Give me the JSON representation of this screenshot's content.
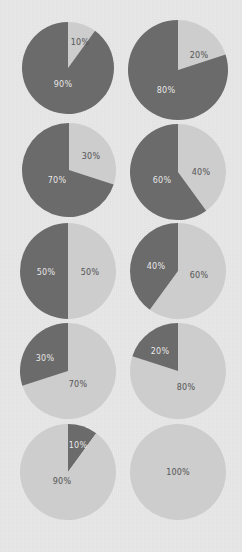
{
  "chart_data": {
    "type": "pie",
    "title": "",
    "xlabel": "",
    "ylabel": "",
    "legend": [],
    "colors": {
      "dark": "#6b6b6b",
      "light": "#cdcdcd",
      "background": "#e8e8e8",
      "label_on_dark": "#eceaea",
      "label_on_light": "#5c5c5c"
    },
    "grid_rows": 5,
    "grid_cols": 2,
    "charts": [
      {
        "id": "pie-1",
        "row": 1,
        "col": 1,
        "cx": 68,
        "cy": 68,
        "r": 46,
        "slices": [
          {
            "name": "light",
            "value": 10,
            "label": "10%",
            "color": "light",
            "start": 0,
            "end": 10,
            "lx": 80,
            "ly": 42
          },
          {
            "name": "dark",
            "value": 90,
            "label": "90%",
            "color": "dark",
            "start": 10,
            "end": 100,
            "lx": 63,
            "ly": 84
          }
        ]
      },
      {
        "id": "pie-2",
        "row": 1,
        "col": 2,
        "cx": 178,
        "cy": 70,
        "r": 50,
        "slices": [
          {
            "name": "light",
            "value": 20,
            "label": "20%",
            "color": "light",
            "start": 0,
            "end": 20,
            "lx": 199,
            "ly": 55
          },
          {
            "name": "dark",
            "value": 80,
            "label": "80%",
            "color": "dark",
            "start": 20,
            "end": 100,
            "lx": 166,
            "ly": 90
          }
        ]
      },
      {
        "id": "pie-3",
        "row": 2,
        "col": 1,
        "cx": 69,
        "cy": 170,
        "r": 47,
        "slices": [
          {
            "name": "light",
            "value": 30,
            "label": "30%",
            "color": "light",
            "start": 0,
            "end": 30,
            "lx": 91,
            "ly": 156
          },
          {
            "name": "dark",
            "value": 70,
            "label": "70%",
            "color": "dark",
            "start": 30,
            "end": 100,
            "lx": 57,
            "ly": 180
          }
        ]
      },
      {
        "id": "pie-4",
        "row": 2,
        "col": 2,
        "cx": 178,
        "cy": 172,
        "r": 48,
        "slices": [
          {
            "name": "light",
            "value": 40,
            "label": "40%",
            "color": "light",
            "start": 0,
            "end": 40,
            "lx": 201,
            "ly": 172
          },
          {
            "name": "dark",
            "value": 60,
            "label": "60%",
            "color": "dark",
            "start": 40,
            "end": 100,
            "lx": 162,
            "ly": 180
          }
        ]
      },
      {
        "id": "pie-5",
        "row": 3,
        "col": 1,
        "cx": 68,
        "cy": 271,
        "r": 48,
        "slices": [
          {
            "name": "light",
            "value": 50,
            "label": "50%",
            "color": "light",
            "start": 0,
            "end": 50,
            "lx": 90,
            "ly": 272
          },
          {
            "name": "dark",
            "value": 50,
            "label": "50%",
            "color": "dark",
            "start": 50,
            "end": 100,
            "lx": 46,
            "ly": 272
          }
        ]
      },
      {
        "id": "pie-6",
        "row": 3,
        "col": 2,
        "cx": 178,
        "cy": 271,
        "r": 48,
        "slices": [
          {
            "name": "light",
            "value": 60,
            "label": "60%",
            "color": "light",
            "start": 0,
            "end": 60,
            "lx": 199,
            "ly": 275
          },
          {
            "name": "dark",
            "value": 40,
            "label": "40%",
            "color": "dark",
            "start": 60,
            "end": 100,
            "lx": 156,
            "ly": 266
          }
        ]
      },
      {
        "id": "pie-7",
        "row": 4,
        "col": 1,
        "cx": 68,
        "cy": 371,
        "r": 48,
        "slices": [
          {
            "name": "light",
            "value": 70,
            "label": "70%",
            "color": "light",
            "start": 0,
            "end": 70,
            "lx": 78,
            "ly": 384
          },
          {
            "name": "dark",
            "value": 30,
            "label": "30%",
            "color": "dark",
            "start": 70,
            "end": 100,
            "lx": 45,
            "ly": 358
          }
        ]
      },
      {
        "id": "pie-8",
        "row": 4,
        "col": 2,
        "cx": 178,
        "cy": 371,
        "r": 48,
        "slices": [
          {
            "name": "light",
            "value": 80,
            "label": "80%",
            "color": "light",
            "start": 0,
            "end": 80,
            "lx": 186,
            "ly": 387
          },
          {
            "name": "dark",
            "value": 20,
            "label": "20%",
            "color": "dark",
            "start": 80,
            "end": 100,
            "lx": 160,
            "ly": 351
          }
        ]
      },
      {
        "id": "pie-9",
        "row": 5,
        "col": 1,
        "cx": 68,
        "cy": 472,
        "r": 48,
        "slices": [
          {
            "name": "dark",
            "value": 10,
            "label": "10%",
            "color": "dark",
            "start": 0,
            "end": 10,
            "lx": 78,
            "ly": 445
          },
          {
            "name": "light",
            "value": 90,
            "label": "90%",
            "color": "light",
            "start": 10,
            "end": 100,
            "lx": 62,
            "ly": 481
          }
        ]
      },
      {
        "id": "pie-10",
        "row": 5,
        "col": 2,
        "cx": 178,
        "cy": 472,
        "r": 48,
        "slices": [
          {
            "name": "light",
            "value": 100,
            "label": "100%",
            "color": "light",
            "start": 0,
            "end": 100,
            "lx": 178,
            "ly": 472
          }
        ]
      }
    ]
  }
}
